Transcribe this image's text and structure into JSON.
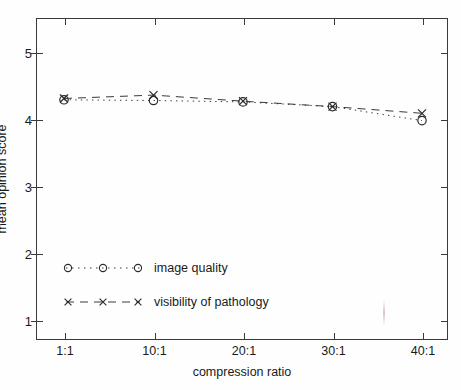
{
  "figure": {
    "background_color": "#fefefe",
    "line_color": "#3a3a3a",
    "text_color": "#1a1a1a"
  },
  "chart_data": {
    "type": "line",
    "title": "",
    "xlabel": "compression ratio",
    "ylabel": "mean opinion score",
    "categories": [
      "1:1",
      "10:1",
      "20:1",
      "30:1",
      "40:1"
    ],
    "xtick_labels": [
      "1:1",
      "10:1",
      "20:1",
      "30:1",
      "40:1"
    ],
    "ytick_labels": [
      "1",
      "2",
      "3",
      "4",
      "5"
    ],
    "ylim": [
      0.7,
      5.5
    ],
    "yticks": [
      1,
      2,
      3,
      4,
      5
    ],
    "grid": "off",
    "legend_position": "inside lower-left",
    "series": [
      {
        "name": "image quality",
        "marker": "circle",
        "linestyle": "dotted",
        "values": [
          4.28,
          4.27,
          4.25,
          4.18,
          3.97
        ]
      },
      {
        "name": "visibility of pathology",
        "marker": "x",
        "linestyle": "dashed",
        "values": [
          4.3,
          4.35,
          4.26,
          4.18,
          4.08
        ]
      }
    ]
  },
  "axes": {
    "y_title": "mean opinion score",
    "x_title": "compression ratio",
    "y_ticks": [
      {
        "label": "5",
        "value": 5
      },
      {
        "label": "4",
        "value": 4
      },
      {
        "label": "3",
        "value": 3
      },
      {
        "label": "2",
        "value": 2
      },
      {
        "label": "1",
        "value": 1
      }
    ],
    "x_ticks": [
      {
        "label": "1:1",
        "value": 1
      },
      {
        "label": "10:1",
        "value": 10
      },
      {
        "label": "20:1",
        "value": 20
      },
      {
        "label": "30:1",
        "value": 30
      },
      {
        "label": "40:1",
        "value": 40
      }
    ]
  },
  "legend": {
    "entries": [
      {
        "label": "image quality",
        "marker": "circle-marker",
        "linestyle": "dotted"
      },
      {
        "label": "visibility of pathology",
        "marker": "x-marker",
        "linestyle": "dashed"
      }
    ]
  }
}
